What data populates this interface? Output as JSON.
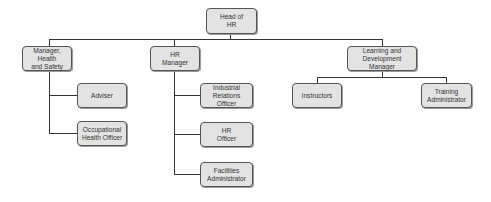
{
  "diagram": {
    "type": "org-chart",
    "root": {
      "label": "Head of\nHR",
      "children": [
        {
          "label": "Manager, Health\nand Safety",
          "children": [
            {
              "label": "Adviser"
            },
            {
              "label": "Occupational\nHealth Officer"
            }
          ]
        },
        {
          "label": "HR\nManager",
          "children": [
            {
              "label": "Industrial Relations\nOfficer"
            },
            {
              "label": "HR\nOfficer"
            },
            {
              "label": "Facilities\nAdministrator"
            }
          ]
        },
        {
          "label": "Learning and\nDevelopment Manager",
          "children": [
            {
              "label": "Instructors"
            },
            {
              "label": "Training\nAdministrator"
            }
          ]
        }
      ]
    },
    "nodes": {
      "head_of_hr": "Head of\nHR",
      "manager_health_safety": "Manager, Health\nand Safety",
      "adviser": "Adviser",
      "occupational_health_officer": "Occupational\nHealth Officer",
      "hr_manager": "HR\nManager",
      "industrial_relations_officer": "Industrial Relations\nOfficer",
      "hr_officer": "HR\nOfficer",
      "facilities_administrator": "Facilities\nAdministrator",
      "learning_development_manager": "Learning and\nDevelopment Manager",
      "instructors": "Instructors",
      "training_administrator": "Training\nAdministrator"
    },
    "colors": {
      "node_fill": "#e3e3e3",
      "node_border": "#555555",
      "connector": "#333333",
      "text": "#333333"
    }
  }
}
